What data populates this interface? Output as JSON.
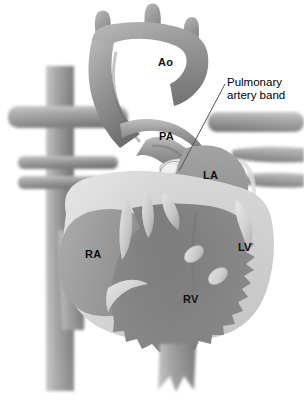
{
  "figure": {
    "modality": "grayscale medical illustration",
    "background_color": "#ffffff"
  },
  "callout": {
    "name": "pulmonary-artery-band",
    "line1": "Pulmonary",
    "line2": "artery band",
    "text_x": 227,
    "text_y": 76,
    "leader": {
      "from_x": 225,
      "from_y": 84,
      "to_x": 179,
      "to_y": 171,
      "color": "#555555"
    }
  },
  "chamber_labels": [
    {
      "id": "ao",
      "text": "Ao",
      "x": 158,
      "y": 57,
      "color": "#111111"
    },
    {
      "id": "pa",
      "text": "PA",
      "x": 159,
      "y": 131,
      "color": "#111111"
    },
    {
      "id": "la",
      "text": "LA",
      "x": 203,
      "y": 170,
      "color": "#111111"
    },
    {
      "id": "ra",
      "text": "RA",
      "x": 85,
      "y": 249,
      "color": "#111111"
    },
    {
      "id": "lv",
      "text": "LV",
      "x": 238,
      "y": 242,
      "color": "#111111"
    },
    {
      "id": "rv",
      "text": "RV",
      "x": 183,
      "y": 294,
      "color": "#111111"
    }
  ],
  "palette": {
    "background": "#ffffff",
    "vessel_mid": "#8d8d8d",
    "vessel_dark": "#6a6a6a",
    "vessel_light": "#b9b9b9",
    "atrium_fill": "#8a8a8a",
    "ventricle_fill": "#6f6f6f",
    "myocardium_rim": "#cfcfcf",
    "band_highlight": "#e6e6e6",
    "valve_light": "#d6d6d6",
    "shadow": "#4a4a4a",
    "label_text": "#111111",
    "callout_text": "#000000",
    "leader_line": "#555555"
  },
  "structures": [
    {
      "id": "aortic-arch",
      "label": "Ao"
    },
    {
      "id": "arch-branch-brachiocephalic",
      "label": ""
    },
    {
      "id": "arch-branch-left-carotid",
      "label": ""
    },
    {
      "id": "arch-branch-left-subclavian",
      "label": ""
    },
    {
      "id": "main-pulmonary-artery",
      "label": "PA"
    },
    {
      "id": "pulmonary-artery-band",
      "label": ""
    },
    {
      "id": "superior-vena-cava",
      "label": ""
    },
    {
      "id": "left-atrium",
      "label": "LA"
    },
    {
      "id": "right-atrium",
      "label": "RA"
    },
    {
      "id": "left-ventricle",
      "label": "LV"
    },
    {
      "id": "right-ventricle",
      "label": "RV"
    },
    {
      "id": "descending-aorta",
      "label": ""
    },
    {
      "id": "pulmonary-veins-right",
      "label": ""
    },
    {
      "id": "pulmonary-veins-left",
      "label": ""
    },
    {
      "id": "inferior-vena-cava",
      "label": ""
    }
  ]
}
